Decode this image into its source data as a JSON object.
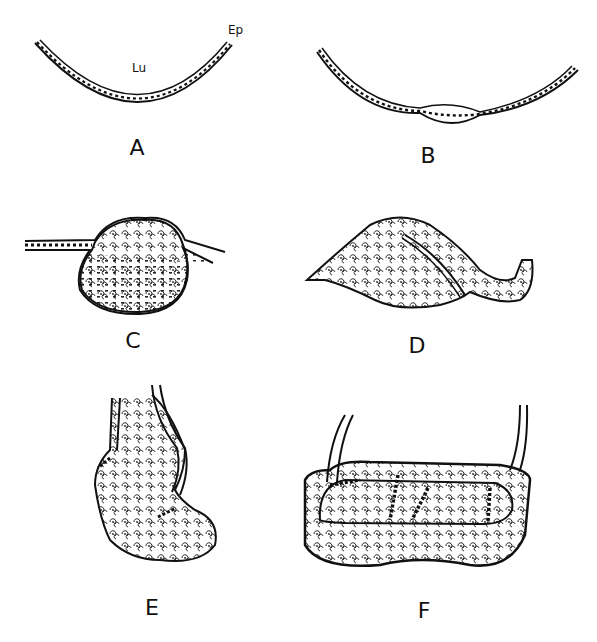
{
  "figure": {
    "annotations": {
      "lumen": "Lu",
      "epithelium": "Ep"
    },
    "panels": [
      {
        "id": "A",
        "label": "A",
        "content": "thin curved epithelial layer lining lumen"
      },
      {
        "id": "B",
        "label": "B",
        "content": "curved epithelium with local thickening at base"
      },
      {
        "id": "C",
        "label": "C",
        "content": "rounded epithelial bud with cells projecting below layer"
      },
      {
        "id": "D",
        "label": "D",
        "content": "elongated bud with cleft beginning to separate a lobe"
      },
      {
        "id": "E",
        "label": "E",
        "content": "bilobed bud with two epithelial stalks"
      },
      {
        "id": "F",
        "label": "F",
        "content": "large oblong mass with internal folded epithelial lumen"
      }
    ]
  }
}
